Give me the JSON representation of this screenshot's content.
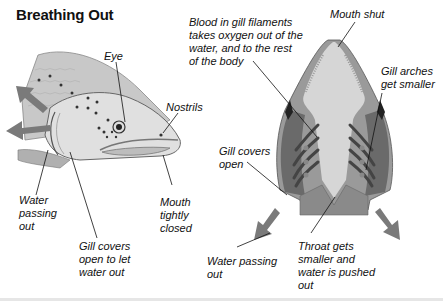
{
  "title": "Breathing Out",
  "side_view": {
    "labels": {
      "eye": "Eye",
      "nostrils": "Nostrils",
      "water_passing_out": [
        "Water",
        "passing",
        "out"
      ],
      "mouth_tightly_closed": [
        "Mouth",
        "tightly",
        "closed"
      ],
      "gill_covers_open": [
        "Gill covers",
        "open to let",
        "water out"
      ]
    }
  },
  "top_view": {
    "labels": {
      "blood_in_gill_filaments": [
        "Blood in gill filaments",
        "takes oxygen out of the",
        "water, and to the rest",
        "of the body"
      ],
      "mouth_shut": "Mouth shut",
      "gill_arches": [
        "Gill arches",
        "get smaller"
      ],
      "gill_covers_open": [
        "Gill covers",
        "open"
      ],
      "water_passing_out": [
        "Water passing",
        "out"
      ],
      "throat": [
        "Throat gets",
        "smaller and",
        "water is pushed",
        "out"
      ]
    }
  },
  "colors": {
    "arrow": "#7a7a7a",
    "fish_light": "#d6d6d6",
    "fish_mid": "#9a9a9a",
    "fish_dark": "#555555",
    "text": "#111111"
  }
}
